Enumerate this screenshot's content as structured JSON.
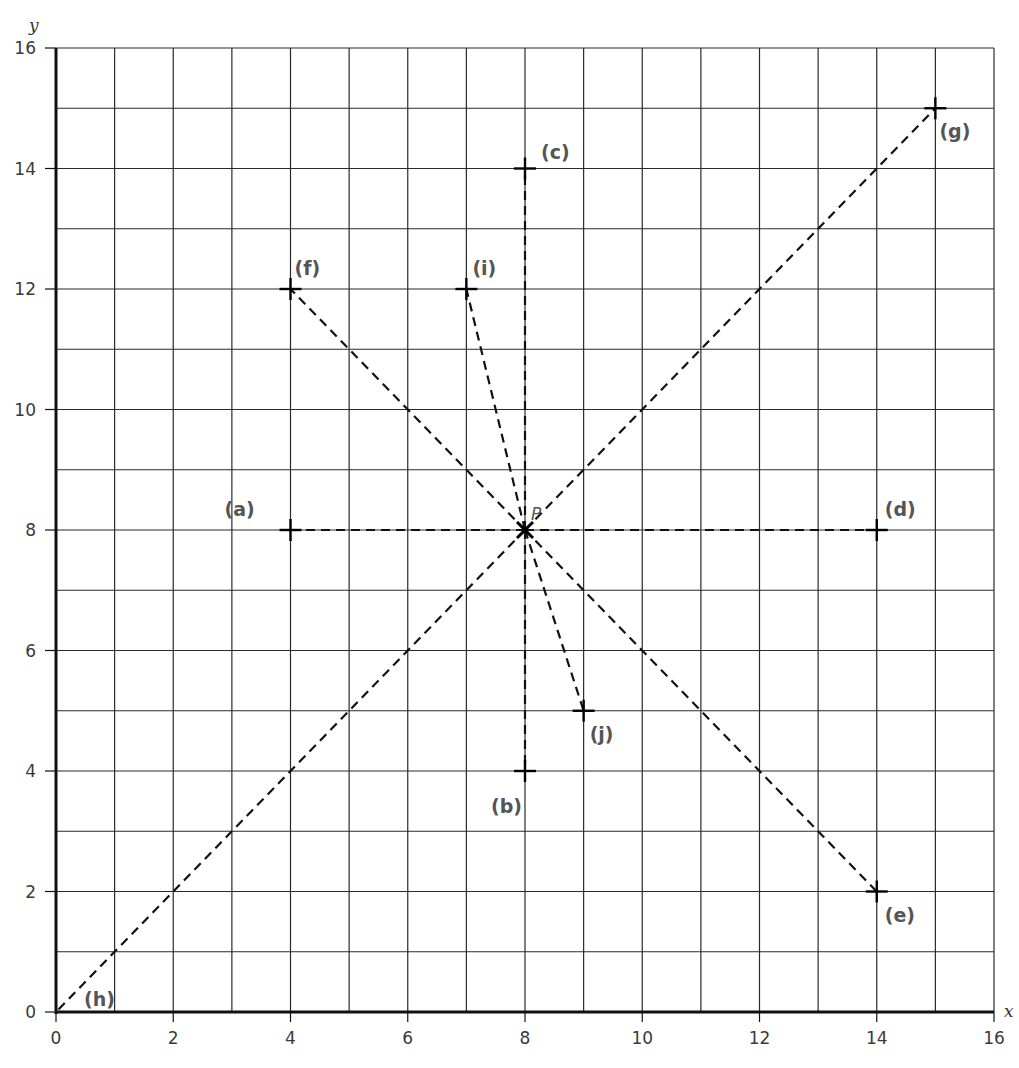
{
  "chart_data": {
    "type": "scatter",
    "title": "",
    "xlabel": "x",
    "ylabel": "y",
    "xlim": [
      0,
      16
    ],
    "ylim": [
      0,
      16
    ],
    "grid": true,
    "grid_step": 1,
    "x_ticks": [
      0,
      2,
      4,
      6,
      8,
      10,
      12,
      14,
      16
    ],
    "y_ticks": [
      0,
      2,
      4,
      6,
      8,
      10,
      12,
      14,
      16
    ],
    "center_point": {
      "label": "P",
      "x": 8,
      "y": 8
    },
    "points": [
      {
        "label": "(a)",
        "x": 4,
        "y": 8
      },
      {
        "label": "(b)",
        "x": 8,
        "y": 4
      },
      {
        "label": "(c)",
        "x": 8,
        "y": 14
      },
      {
        "label": "(d)",
        "x": 14,
        "y": 8
      },
      {
        "label": "(e)",
        "x": 14,
        "y": 2
      },
      {
        "label": "(f)",
        "x": 4,
        "y": 12
      },
      {
        "label": "(g)",
        "x": 15,
        "y": 15
      },
      {
        "label": "(h)",
        "x": 0,
        "y": 0
      },
      {
        "label": "(i)",
        "x": 7,
        "y": 12
      },
      {
        "label": "(j)",
        "x": 9,
        "y": 5
      }
    ],
    "lines": "dashed segments from each point to P(8, 8)",
    "legend": null
  },
  "colors": {
    "grid": "#2a2a2a",
    "axis": "#111111",
    "dash": "#111111",
    "label": "#555555"
  }
}
